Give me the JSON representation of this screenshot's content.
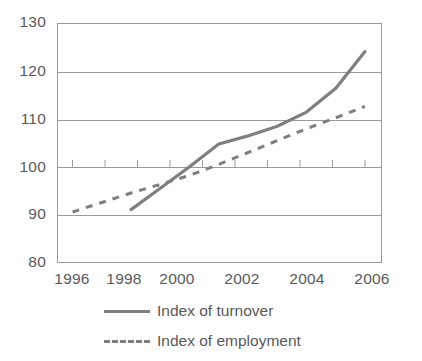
{
  "chart_data": {
    "type": "line",
    "title": "",
    "subtitle": "",
    "xlabel": "",
    "ylabel": "",
    "xlim": [
      1996,
      2006
    ],
    "ylim": [
      80,
      130
    ],
    "y_ticks": [
      130,
      120,
      110,
      100,
      90,
      80
    ],
    "x_ticks": [
      1996,
      1998,
      2000,
      2002,
      2004,
      2006
    ],
    "x_minor_ticks": [
      1997,
      1999,
      2001,
      2003,
      2005
    ],
    "grid": "horizontal",
    "legend_position": "bottom",
    "series": [
      {
        "name": "Index of turnover",
        "style": "solid",
        "color": "#7f7f7f",
        "x": [
          1998,
          1999,
          2000,
          2001,
          2002,
          2003,
          2004,
          2005,
          2006
        ],
        "values": [
          91.0,
          95.5,
          100.0,
          104.8,
          106.5,
          108.5,
          111.5,
          116.5,
          124.2
        ]
      },
      {
        "name": "Index of employment",
        "style": "dashed",
        "color": "#7f7f7f",
        "x": [
          1996,
          1997,
          1998,
          1999,
          2000,
          2001,
          2002,
          2003,
          2004,
          2005,
          2006
        ],
        "values": [
          90.5,
          92.5,
          94.5,
          96.3,
          98.2,
          100.5,
          103.0,
          105.5,
          108.0,
          110.3,
          112.7
        ]
      }
    ],
    "y_tick_labels": [
      "130",
      "120",
      "110",
      "100",
      "90",
      "80"
    ],
    "x_tick_labels": [
      "1996",
      "1998",
      "2000",
      "2002",
      "2004",
      "2006"
    ],
    "legend": [
      {
        "label": "Index of turnover",
        "style": "solid"
      },
      {
        "label": "Index of employment",
        "style": "dashed"
      }
    ]
  }
}
